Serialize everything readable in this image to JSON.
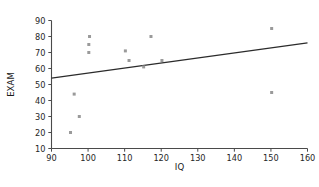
{
  "chart_data": {
    "type": "scatter",
    "title": "",
    "xlabel": "IQ",
    "ylabel": "EXAM",
    "xlim": [
      90,
      160
    ],
    "ylim": [
      10,
      90
    ],
    "xticks": [
      90,
      100,
      110,
      120,
      130,
      140,
      150,
      160
    ],
    "yticks": [
      10,
      20,
      30,
      40,
      50,
      60,
      70,
      80,
      90
    ],
    "grid": false,
    "legend": null,
    "marker_color": "#9a9a9a",
    "line_color": "#2b2b2b",
    "axis_color": "#4a4a4a",
    "points": [
      {
        "x": 95.2,
        "y": 20
      },
      {
        "x": 97.6,
        "y": 30
      },
      {
        "x": 96.2,
        "y": 44
      },
      {
        "x": 100.2,
        "y": 70
      },
      {
        "x": 100.2,
        "y": 75
      },
      {
        "x": 100.4,
        "y": 80
      },
      {
        "x": 110.2,
        "y": 71
      },
      {
        "x": 111.2,
        "y": 65
      },
      {
        "x": 115.2,
        "y": 61
      },
      {
        "x": 117.2,
        "y": 80
      },
      {
        "x": 120.2,
        "y": 65
      },
      {
        "x": 150.2,
        "y": 85
      },
      {
        "x": 150.2,
        "y": 45
      }
    ],
    "trendline": {
      "name": "linear-fit",
      "x": [
        90,
        160
      ],
      "y": [
        54,
        76
      ]
    }
  }
}
